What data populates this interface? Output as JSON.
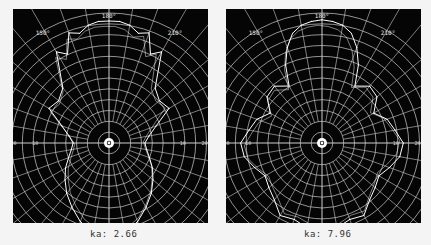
{
  "chart_data": [
    {
      "type": "polar-line",
      "title": "",
      "caption": "ka: 2.66",
      "angular_labels": [
        "150°",
        "180°",
        "210°"
      ],
      "radial_labels_left": [
        "30",
        "20",
        "10"
      ],
      "radial_labels_right": [
        "10",
        "20",
        "30"
      ],
      "radial_unit": "dB",
      "rings": 12,
      "spokes_deg": 10,
      "grid": true,
      "colors": {
        "background": "#050505",
        "grid": "#cfcfcf",
        "trace": "#ffffff"
      },
      "series": [
        {
          "name": "measured",
          "angles_deg": [
            0,
            10,
            20,
            30,
            40,
            50,
            60,
            70,
            80,
            90,
            100,
            110,
            120,
            130,
            140,
            150,
            155,
            160,
            165,
            170,
            175,
            180,
            185,
            190,
            195,
            200,
            205,
            210,
            220,
            230,
            240,
            250,
            260,
            270,
            280,
            290,
            300,
            310,
            320,
            330,
            340,
            350
          ],
          "values": [
            0.78,
            0.76,
            0.7,
            0.62,
            0.55,
            0.48,
            0.42,
            0.36,
            0.32,
            0.3,
            0.34,
            0.42,
            0.58,
            0.55,
            0.6,
            0.88,
            0.82,
            0.98,
            0.95,
            1.0,
            1.02,
            1.02,
            1.02,
            1.0,
            0.95,
            0.98,
            0.82,
            0.88,
            0.6,
            0.55,
            0.58,
            0.42,
            0.34,
            0.3,
            0.32,
            0.36,
            0.42,
            0.48,
            0.55,
            0.62,
            0.7,
            0.76
          ]
        }
      ]
    },
    {
      "type": "polar-line",
      "title": "",
      "caption": "ka: 7.96",
      "angular_labels": [
        "150°",
        "180°",
        "210°"
      ],
      "radial_labels_left": [
        "30",
        "20",
        "10"
      ],
      "radial_labels_right": [
        "10",
        "20",
        "30"
      ],
      "radial_unit": "dB",
      "rings": 12,
      "spokes_deg": 10,
      "grid": true,
      "colors": {
        "background": "#050505",
        "grid": "#cfcfcf",
        "trace": "#ffffff"
      },
      "series": [
        {
          "name": "measured",
          "angles_deg": [
            0,
            10,
            20,
            30,
            40,
            50,
            60,
            70,
            80,
            90,
            100,
            110,
            120,
            130,
            140,
            150,
            155,
            160,
            165,
            170,
            175,
            180,
            185,
            190,
            195,
            200,
            205,
            210,
            220,
            230,
            240,
            250,
            260,
            270,
            280,
            290,
            300,
            310,
            320,
            330,
            340,
            350
          ],
          "values": [
            0.82,
            0.72,
            0.68,
            0.7,
            0.62,
            0.58,
            0.55,
            0.6,
            0.66,
            0.68,
            0.62,
            0.58,
            0.5,
            0.6,
            0.62,
            0.55,
            0.72,
            0.85,
            0.95,
            1.0,
            1.02,
            1.03,
            1.02,
            1.0,
            0.95,
            0.85,
            0.72,
            0.55,
            0.62,
            0.6,
            0.5,
            0.58,
            0.62,
            0.68,
            0.66,
            0.6,
            0.55,
            0.58,
            0.62,
            0.7,
            0.68,
            0.72
          ]
        }
      ]
    }
  ]
}
